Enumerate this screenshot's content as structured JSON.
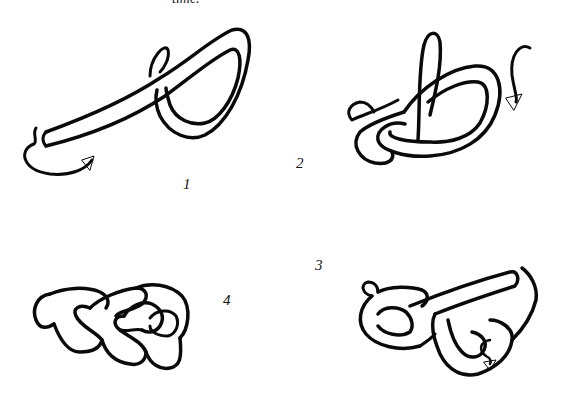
{
  "page": {
    "clipped_text": "time."
  },
  "figures": [
    {
      "step": "1",
      "label": "1",
      "description": "rope end laid over forming a loop with arrow showing end passing under"
    },
    {
      "step": "2",
      "label": "2",
      "description": "working end passed through loop with curved arrow"
    },
    {
      "step": "3",
      "label": "3",
      "description": "second loop interlaced with arrow showing end tucked through"
    },
    {
      "step": "4",
      "label": "4",
      "description": "finished knot tightened"
    }
  ],
  "colors": {
    "ink": "#0a0a0a",
    "background": "#ffffff"
  }
}
